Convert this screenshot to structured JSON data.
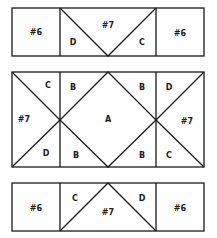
{
  "colors": {
    "line": "#1a1a1a",
    "background": "#ffffff"
  },
  "top_row": {
    "left_block": "#6",
    "center_block": "#7",
    "center_left_triangle": "D",
    "center_right_triangle": "C",
    "right_block": "#6"
  },
  "middle_row": {
    "left_square": {
      "top": "C",
      "left": "#7",
      "bottom": "D"
    },
    "center": {
      "top_left": "B",
      "top_right": "B",
      "diamond": "A",
      "bottom_left": "B",
      "bottom_right": "B"
    },
    "right_square": {
      "top": "D",
      "right": "#7",
      "bottom": "C"
    }
  },
  "bottom_row": {
    "left_block": "#6",
    "center_left_triangle": "C",
    "center_block": "#7",
    "center_right_triangle": "D",
    "right_block": "#6"
  }
}
